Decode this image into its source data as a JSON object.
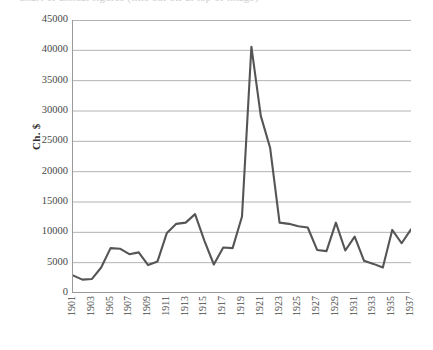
{
  "title_cropped": "Chart of annual figures (title cut off at top of image)",
  "axis": {
    "y_label": "Ch. $",
    "y_ticks": [
      0,
      5000,
      10000,
      15000,
      20000,
      25000,
      30000,
      35000,
      40000,
      45000
    ],
    "y_tick_labels": [
      "0",
      "5000",
      "10000",
      "15000",
      "20000",
      "25000",
      "30000",
      "35000",
      "40000",
      "45000"
    ],
    "x_tick_labels": [
      "1901",
      "1903",
      "1905",
      "1907",
      "1909",
      "1911",
      "1913",
      "1915",
      "1917",
      "1919",
      "1921",
      "1923",
      "1925",
      "1927",
      "1929",
      "1931",
      "1933",
      "1935",
      "1937"
    ]
  },
  "colors": {
    "line": "#555555",
    "grid": "#b3b3b3",
    "axis": "#9a9a9a",
    "text": "#474747",
    "background": "#ffffff"
  },
  "chart_data": {
    "type": "line",
    "title": "",
    "xlabel": "",
    "ylabel": "Ch. $",
    "ylim": [
      0,
      45000
    ],
    "xlim": [
      1901,
      1937
    ],
    "grid": true,
    "legend": "none",
    "x": [
      1901,
      1902,
      1903,
      1904,
      1905,
      1906,
      1907,
      1908,
      1909,
      1910,
      1911,
      1912,
      1913,
      1914,
      1915,
      1916,
      1917,
      1918,
      1919,
      1920,
      1921,
      1922,
      1923,
      1924,
      1925,
      1926,
      1927,
      1928,
      1929,
      1930,
      1931,
      1932,
      1933,
      1934,
      1935,
      1936,
      1937
    ],
    "series": [
      {
        "name": "Ch. $",
        "values": [
          2900,
          2200,
          2300,
          4200,
          7400,
          7300,
          6400,
          6700,
          4600,
          5200,
          9900,
          11400,
          11600,
          13000,
          8600,
          4700,
          7500,
          7400,
          12600,
          40600,
          29200,
          23900,
          11600,
          11400,
          11000,
          10800,
          7100,
          6900,
          11600,
          7000,
          9300,
          5300,
          4800,
          4200,
          10400,
          8200,
          10500
        ]
      }
    ]
  }
}
